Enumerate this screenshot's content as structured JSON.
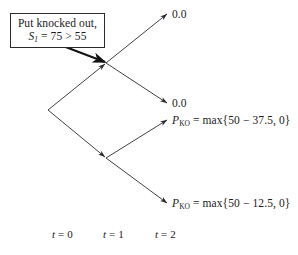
{
  "figure": {
    "type": "binomial-tree-diagram",
    "background_color": "#ffffff",
    "line_color": "#2b2b2b"
  },
  "callout": {
    "line1": "Put knocked out,",
    "symbol": "S",
    "subscript": "1",
    "relation": " = 75 > 55",
    "box_border_color": "#2b2b2b"
  },
  "terminals": [
    {
      "label": "0.0",
      "x": 172,
      "y": 9
    },
    {
      "label": "0.0",
      "x": 172,
      "y": 98
    },
    {
      "symbol": "P",
      "subscript": "KO",
      "expression": " = max{50 − 37.5, 0}",
      "x": 172,
      "y": 115
    },
    {
      "symbol": "P",
      "subscript": "KO",
      "expression": " = max{50 − 12.5, 0}",
      "x": 172,
      "y": 198
    }
  ],
  "time_axis": [
    {
      "var": "t",
      "label": " = 0",
      "x": 52
    },
    {
      "var": "t",
      "label": " = 1",
      "x": 103
    },
    {
      "var": "t",
      "label": " = 2",
      "x": 155
    }
  ],
  "nodes": {
    "root": {
      "x": 48,
      "y": 110
    },
    "up": {
      "x": 106,
      "y": 63
    },
    "down": {
      "x": 106,
      "y": 158
    }
  }
}
